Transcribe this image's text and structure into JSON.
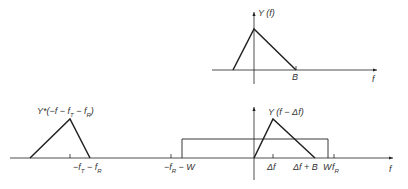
{
  "colors": {
    "stroke": "#222222",
    "background": "#ffffff"
  },
  "top_plot": {
    "ylabel": "Y (f)",
    "xlabel": "f",
    "tick_B": "B"
  },
  "bottom_plot": {
    "mirror_label": "Y*(−f − f_T − f_R)",
    "shift_label": "Y (f − Δf)",
    "xlabel": "f",
    "ticks": {
      "neg_fT_fR": "−f_T − f_R",
      "neg_fR_W": "−f_R − W",
      "delta_f": "Δf",
      "delta_f_B": "Δf + B",
      "W": "W",
      "f_R": "f_R"
    }
  }
}
